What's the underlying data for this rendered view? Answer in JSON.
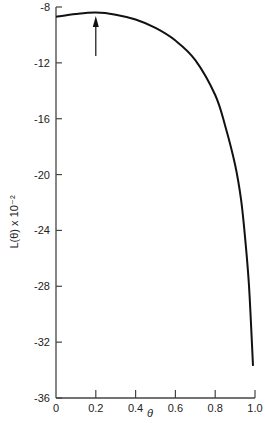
{
  "chart_data": {
    "type": "line",
    "title": "",
    "xlabel": "θ",
    "ylabel": "L(θ) x 10⁻²",
    "xlim": [
      0,
      1.0
    ],
    "ylim": [
      -36,
      -8
    ],
    "grid": false,
    "legend": null,
    "x_ticks": [
      0,
      0.2,
      0.4,
      0.6,
      0.8,
      1.0
    ],
    "x_tick_labels": [
      "0",
      "0.2",
      "0.4",
      "0.6",
      "0.8",
      "1.0"
    ],
    "y_ticks": [
      -8,
      -12,
      -16,
      -20,
      -24,
      -28,
      -32,
      -36
    ],
    "y_tick_labels": [
      "-8",
      "-12",
      "-16",
      "-20",
      "-24",
      "-28",
      "-32",
      "-36"
    ],
    "series": [
      {
        "name": "L(θ)",
        "x": [
          0,
          0.1,
          0.2,
          0.3,
          0.4,
          0.5,
          0.6,
          0.7,
          0.8,
          0.85,
          0.9,
          0.93,
          0.95,
          0.97,
          0.99
        ],
        "values": [
          -8.7,
          -8.5,
          -8.4,
          -8.55,
          -8.9,
          -9.5,
          -10.4,
          -11.8,
          -14.3,
          -16.5,
          -19.3,
          -21.8,
          -24.5,
          -28.0,
          -33.7
        ]
      }
    ],
    "annotations": [
      {
        "type": "arrow",
        "x": 0.2,
        "from_y": -11.5,
        "to_y": -8.5,
        "note": "maximum marker"
      }
    ]
  }
}
